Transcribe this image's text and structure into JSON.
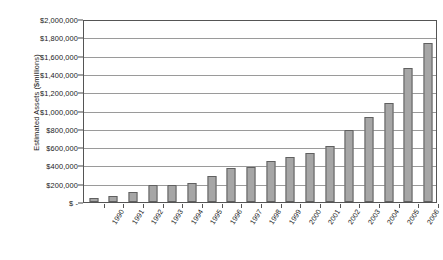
{
  "chart_data": {
    "type": "bar",
    "title": "",
    "xlabel": "",
    "ylabel": "Estimated Assets ($millions)",
    "ylim": [
      0,
      2000000
    ],
    "ytick_step": 200000,
    "grid": true,
    "legend": false,
    "bar_color": "#a6a6a6",
    "bar_border_color": "#606060",
    "categories": [
      "1990",
      "1991",
      "1992",
      "1993",
      "1994",
      "1995",
      "1996",
      "1997",
      "1998",
      "1999",
      "2000",
      "2001",
      "2002",
      "2003",
      "2004",
      "2005",
      "2006",
      "Q2\n2007"
    ],
    "values": [
      40000,
      70000,
      105000,
      185000,
      185000,
      205000,
      285000,
      375000,
      385000,
      450000,
      490000,
      535000,
      610000,
      790000,
      925000,
      1085000,
      1460000,
      1740000
    ],
    "ytick_labels": [
      "$2,000,000",
      "$1,800,000",
      "$1,600,000",
      "$1,400,000",
      "$1,200,000",
      "$1,000,000",
      "$800,000",
      "$600,000",
      "$400,000",
      "$200,000",
      "$ -"
    ],
    "ytick_values": [
      2000000,
      1800000,
      1600000,
      1400000,
      1200000,
      1000000,
      800000,
      600000,
      400000,
      200000,
      0
    ]
  }
}
